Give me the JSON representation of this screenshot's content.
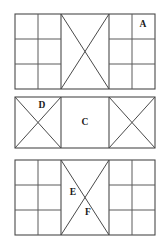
{
  "figure": {
    "background_color": "#ffffff",
    "line_color": "#4a4a4a",
    "label_color": "#1a1a1a",
    "panel_count": 3
  },
  "panels": [
    {
      "id": "panel-top",
      "name": "top-panel",
      "x": 15,
      "y": 14,
      "width": 140,
      "height": 75,
      "sections": [
        {
          "id": "top-left-grid",
          "kind": "grid",
          "x": 15,
          "width": 46,
          "columns": 2,
          "rows": 3,
          "column_lines": [
            38
          ],
          "row_lines": [
            39,
            64
          ]
        },
        {
          "id": "top-middle-brace",
          "kind": "x-brace",
          "x": 61,
          "width": 48
        },
        {
          "id": "top-right-grid",
          "kind": "grid",
          "x": 109,
          "width": 46,
          "columns": 2,
          "rows": 3,
          "column_lines": [
            132
          ],
          "row_lines": [
            39,
            64
          ]
        }
      ],
      "labels": [
        {
          "text": "A",
          "x": 143,
          "y": 25,
          "section": "top-right-grid",
          "cell": "row-1-col-2"
        }
      ]
    },
    {
      "id": "panel-middle",
      "name": "middle-panel",
      "x": 15,
      "y": 97,
      "width": 140,
      "height": 51,
      "sections": [
        {
          "id": "mid-left-brace",
          "kind": "x-brace",
          "x": 15,
          "width": 46
        },
        {
          "id": "mid-center-open",
          "kind": "open",
          "x": 61,
          "width": 48
        },
        {
          "id": "mid-right-brace",
          "kind": "x-brace",
          "x": 109,
          "width": 46
        }
      ],
      "labels": [
        {
          "text": "D",
          "x": 42,
          "y": 106,
          "section": "mid-left-brace",
          "cell": "upper"
        },
        {
          "text": "C",
          "x": 85,
          "y": 123,
          "section": "mid-center-open",
          "cell": "center"
        }
      ]
    },
    {
      "id": "panel-bottom",
      "name": "bottom-panel",
      "x": 15,
      "y": 160,
      "width": 140,
      "height": 75,
      "sections": [
        {
          "id": "bot-left-grid",
          "kind": "grid",
          "x": 15,
          "width": 46,
          "columns": 2,
          "rows": 3,
          "column_lines": [
            38
          ],
          "row_lines": [
            185,
            210
          ]
        },
        {
          "id": "bot-middle-brace",
          "kind": "x-brace",
          "x": 61,
          "width": 48
        },
        {
          "id": "bot-right-grid",
          "kind": "grid",
          "x": 109,
          "width": 46,
          "columns": 2,
          "rows": 3,
          "column_lines": [
            132
          ],
          "row_lines": [
            185,
            210
          ]
        }
      ],
      "labels": [
        {
          "text": "E",
          "x": 73,
          "y": 193,
          "section": "bot-middle-brace",
          "cell": "left-of-center"
        },
        {
          "text": "F",
          "x": 88,
          "y": 213,
          "section": "bot-middle-brace",
          "cell": "below-center"
        }
      ]
    }
  ]
}
